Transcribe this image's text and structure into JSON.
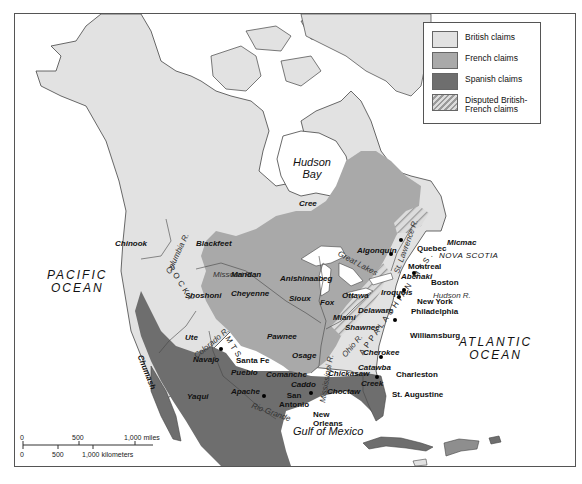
{
  "legend": {
    "items": [
      {
        "label": "British claims",
        "color": "#e2e2e2",
        "pattern": "solid"
      },
      {
        "label": "French claims",
        "color": "#a9a9a9",
        "pattern": "solid"
      },
      {
        "label": "Spanish claims",
        "color": "#6e6e6e",
        "pattern": "solid"
      },
      {
        "label": "Disputed British-French claims",
        "color": "#cfcfcf",
        "pattern": "diagonal-hatch"
      }
    ]
  },
  "bodies_of_water": {
    "pacific": "PACIFIC OCEAN",
    "pacific_line1": "PACIFIC",
    "pacific_line2": "OCEAN",
    "atlantic_line1": "ATLANTIC",
    "atlantic_line2": "OCEAN",
    "hudson_line1": "Hudson",
    "hudson_line2": "Bay",
    "gulf": "Gulf of Mexico"
  },
  "regions": {
    "nova_scotia": "NOVA SCOTIA"
  },
  "mountains": {
    "rocky": "ROCKY",
    "rocky_mts": "MTS.",
    "appalachian": "APPALACHIAN MTS."
  },
  "rivers": {
    "columbia": "Columbia R.",
    "missouri": "Missouri R.",
    "colorado": "Colorado R.",
    "st_lawrence": "St. Lawrence R.",
    "hudson": "Hudson R.",
    "ohio": "Ohio R.",
    "mississippi": "Mississippi R.",
    "rio_grande": "Rio Grande",
    "great_lakes": "Great Lakes"
  },
  "tribes": {
    "cree": "Cree",
    "chinook": "Chinook",
    "blackfeet": "Blackfeet",
    "mandan": "Mandan",
    "shoshoni": "Shoshoni",
    "cheyenne": "Cheyenne",
    "anishinaabeg": "Anishinaabeg",
    "sioux": "Sioux",
    "fox": "Fox",
    "algonquin": "Algonquin",
    "ottawa": "Ottawa",
    "iroquois": "Iroquois",
    "abenaki": "Abenaki",
    "micmac": "Micmac",
    "miami": "Miami",
    "delaware": "Delaware",
    "shawnee": "Shawnee",
    "ute": "Ute",
    "navajo": "Navajo",
    "pawnee": "Pawnee",
    "osage": "Osage",
    "pueblo": "Pueblo",
    "comanche": "Comanche",
    "apache": "Apache",
    "caddo": "Caddo",
    "cherokee": "Cherokee",
    "catawba": "Catawba",
    "chickasaw": "Chickasaw",
    "creek": "Creek",
    "choctaw": "Choctaw",
    "chumash": "Chumash",
    "yaqui": "Yaqui"
  },
  "cities": {
    "quebec": "Quebec",
    "montreal": "Montreal",
    "boston": "Boston",
    "new_york": "New York",
    "philadelphia": "Philadelphia",
    "williamsburg": "Williamsburg",
    "charleston": "Charleston",
    "st_augustine": "St. Augustine",
    "santa_fe": "Santa Fe",
    "san_antonio_line1": "San",
    "san_antonio_line2": "Antonio",
    "new_orleans_line1": "New",
    "new_orleans_line2": "Orleans"
  },
  "scale_bar": {
    "miles_ticks": [
      "0",
      "500",
      "1,000 miles"
    ],
    "km_ticks": [
      "0",
      "500",
      "1,000 kilometers"
    ]
  }
}
